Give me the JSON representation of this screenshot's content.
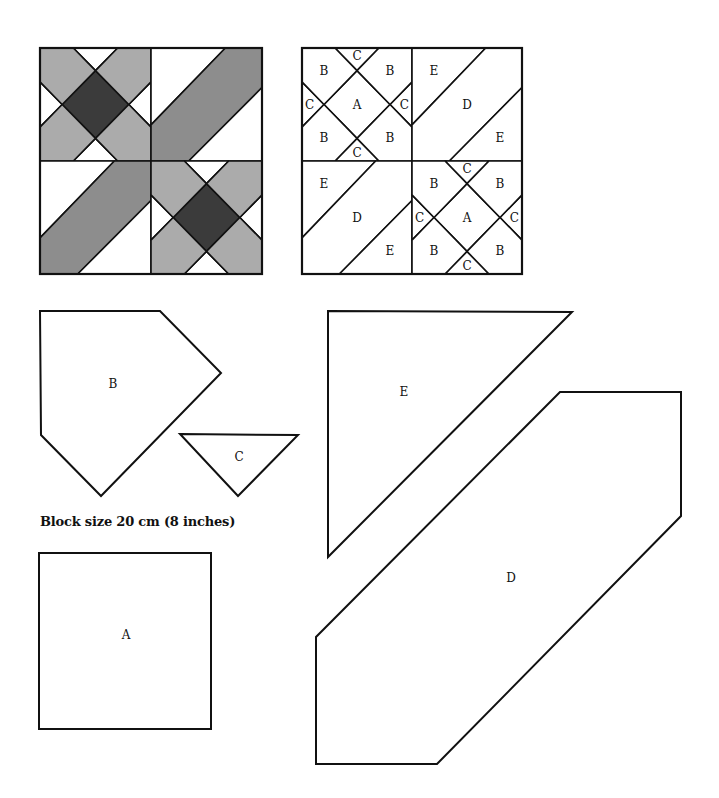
{
  "caption": "Block size 20 cm (8 inches)",
  "colors": {
    "outline": "#111111",
    "background": "#ffffff",
    "piece_A_fill": "#3b3b3b",
    "piece_B_fill": "#ababab",
    "piece_C_fill": "#ffffff",
    "piece_D_fill": "#8d8d8d",
    "piece_E_fill": "#ffffff"
  },
  "colored_block": {
    "description": "Shaded quilt block, 2x2 quadrants",
    "quadrants": [
      "A/B/C star",
      "E/D/E diagonal band",
      "E/D/E diagonal band",
      "A/B/C star"
    ]
  },
  "labeled_block": {
    "top_left": {
      "A": "A",
      "B": [
        "B",
        "B",
        "B",
        "B"
      ],
      "C": [
        "C",
        "C",
        "C",
        "C"
      ]
    },
    "top_right": {
      "E1": "E",
      "D": "D",
      "E2": "E"
    },
    "bottom_left": {
      "E1": "E",
      "D": "D",
      "E2": "E"
    },
    "bottom_right": {
      "A": "A",
      "B": [
        "B",
        "B",
        "B",
        "B"
      ],
      "C": [
        "C",
        "C",
        "C",
        "C"
      ]
    }
  },
  "templates": {
    "A": "A",
    "B": "B",
    "C": "C",
    "D": "D",
    "E": "E"
  }
}
